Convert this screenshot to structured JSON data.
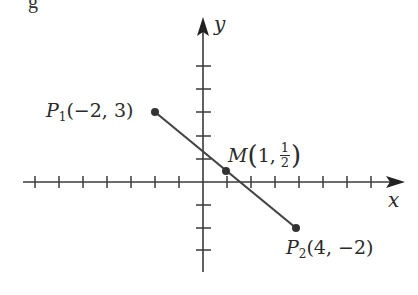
{
  "figure": {
    "caption_fragment": "g",
    "axes": {
      "x_label": "x",
      "y_label": "y",
      "origin_px": [
        203,
        182
      ],
      "unit_px": [
        24,
        23.3
      ],
      "x_ticks": [
        -7,
        -6,
        -5,
        -4,
        -3,
        -2,
        -1,
        1,
        2,
        3,
        4,
        5,
        6,
        7
      ],
      "y_ticks": [
        -3,
        -2,
        -1,
        1,
        2,
        3,
        4,
        5
      ],
      "colors": {
        "axis": "#3a3a3a",
        "segment": "#444444",
        "point": "#333333",
        "text": "#2a2a2a"
      }
    },
    "points": {
      "p1": {
        "name": "P",
        "sub": "1",
        "coords": "(−2, 3)",
        "x": -2,
        "y": 3
      },
      "m": {
        "name": "M",
        "coords_prefix": "1,",
        "frac_num": "1",
        "frac_den": "2",
        "x": 1,
        "y": 0.5
      },
      "p2": {
        "name": "P",
        "sub": "2",
        "coords": "(4, −2)",
        "x": 4,
        "y": -2
      }
    },
    "segment": {
      "from": "P1",
      "to": "P2",
      "midpoint": "M"
    }
  }
}
